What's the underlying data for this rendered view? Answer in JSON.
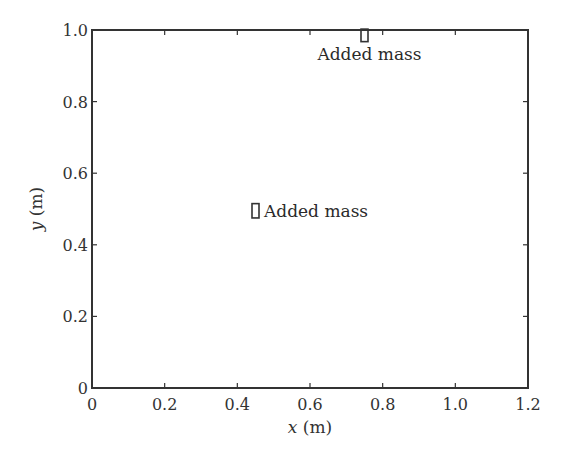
{
  "chart_data": {
    "type": "scatter",
    "title": "",
    "xlabel": "x (m)",
    "ylabel": "y (m)",
    "xlim": [
      0,
      1.2
    ],
    "ylim": [
      0,
      1.0
    ],
    "grid": false,
    "x_ticks": [
      0,
      0.2,
      0.4,
      0.6,
      0.8,
      1.0,
      1.2
    ],
    "x_tick_labels": [
      "0",
      "0.2",
      "0.4",
      "0.6",
      "0.8",
      "1.0",
      "1.2"
    ],
    "y_ticks": [
      0,
      0.2,
      0.4,
      0.6,
      0.8,
      1.0
    ],
    "y_tick_labels": [
      "0",
      "0.2",
      "0.4",
      "0.6",
      "0.8",
      "1.0"
    ],
    "annotations": [
      {
        "label": "Added mass",
        "x": 0.75,
        "y": 0.985,
        "marker": "rectangle",
        "width": 0.02,
        "height": 0.035,
        "text_position": "below"
      },
      {
        "label": "Added mass",
        "x": 0.45,
        "y": 0.495,
        "marker": "rectangle",
        "width": 0.02,
        "height": 0.04,
        "text_position": "right"
      }
    ]
  },
  "axes": {
    "x_label_italic": "x",
    "x_label_unit": " (m)",
    "y_label_italic": "y",
    "y_label_unit": " (m)"
  }
}
